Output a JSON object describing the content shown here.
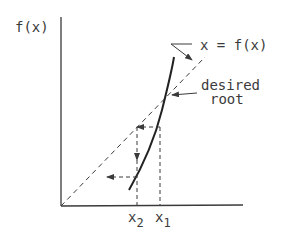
{
  "diagram": {
    "y_axis_label": "f(x)",
    "line_label": "x = f(x)",
    "root_label_line1": "desired",
    "root_label_line2": "root",
    "x1_label": "x",
    "x1_sub": "1",
    "x2_label": "x",
    "x2_sub": "2",
    "colors": {
      "ink": "#3a3a3a",
      "background": "#ffffff"
    }
  }
}
